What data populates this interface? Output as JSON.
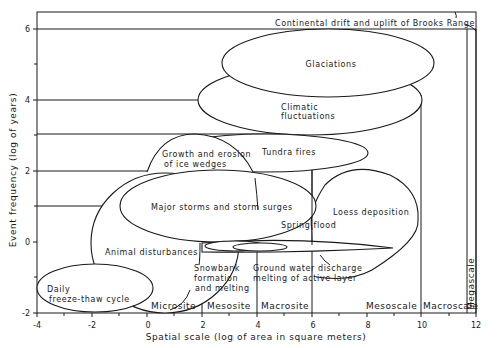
{
  "chart": {
    "x_axis": {
      "label": "Spatial scale (log of area in square meters)",
      "ticks": [
        "-4",
        "-2",
        "0",
        "2",
        "4",
        "6",
        "8",
        "10",
        "12"
      ]
    },
    "y_axis": {
      "label": "Event frequency (log of years)",
      "ticks": [
        "6",
        "4",
        "2",
        "0",
        "-2"
      ]
    },
    "events": {
      "continental_drift": "Continental drift and uplift of Brooks Range",
      "glaciations": "Glaciations",
      "climatic_1": "Climatic",
      "climatic_2": "fluctuations",
      "tundra_fires": "Tundra fires",
      "ice_wedges_1": "Growth and erosion",
      "ice_wedges_2": "of ice wedges",
      "major_storms": "Major storms and storm surges",
      "loess": "Loess deposition",
      "spring_flood": "Spring flood",
      "animal": "Animal disturbances",
      "snowbank_1": "Snowbank",
      "snowbank_2": "formation",
      "snowbank_3": "and melting",
      "groundwater_1": "Ground water discharge",
      "groundwater_2": "melting of active layer",
      "daily_1": "Daily",
      "daily_2": "freeze-thaw cycle"
    },
    "scales": {
      "microsite": "Microsite",
      "mesosite": "Mesosite",
      "macrosite": "Macrosite",
      "mesoscale": "Mesoscale",
      "macroscale": "Macroscale",
      "megascale": "Megascale"
    }
  }
}
